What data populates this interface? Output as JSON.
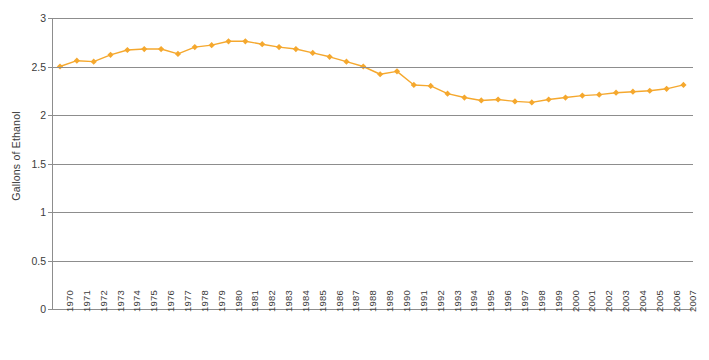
{
  "chart_data": {
    "type": "line",
    "title": "",
    "xlabel": "",
    "ylabel": "Gallons of Ethanol",
    "ylim": [
      0,
      3
    ],
    "yticks": [
      0,
      0.5,
      1,
      1.5,
      2,
      2.5,
      3
    ],
    "ytick_labels": [
      "0",
      "0.5",
      "1",
      "1.5",
      "2",
      "2.5",
      "3"
    ],
    "grid": true,
    "legend": "none",
    "series_color": "#f5a82e",
    "marker": "diamond",
    "categories": [
      "1970",
      "1971",
      "1972",
      "1973",
      "1974",
      "1975",
      "1976",
      "1977",
      "1978",
      "1979",
      "1980",
      "1981",
      "1982",
      "1983",
      "1984",
      "1985",
      "1986",
      "1987",
      "1988",
      "1989",
      "1990",
      "1991",
      "1992",
      "1993",
      "1994",
      "1995",
      "1996",
      "1997",
      "1998",
      "1999",
      "2000",
      "2001",
      "2002",
      "2003",
      "2004",
      "2005",
      "2006",
      "2007"
    ],
    "series": [
      {
        "name": "Gallons of Ethanol",
        "values": [
          2.5,
          2.56,
          2.55,
          2.62,
          2.67,
          2.68,
          2.68,
          2.63,
          2.7,
          2.72,
          2.76,
          2.76,
          2.73,
          2.7,
          2.68,
          2.64,
          2.6,
          2.55,
          2.5,
          2.42,
          2.45,
          2.31,
          2.3,
          2.22,
          2.18,
          2.15,
          2.16,
          2.14,
          2.13,
          2.16,
          2.18,
          2.2,
          2.21,
          2.23,
          2.24,
          2.25,
          2.27,
          2.31
        ]
      }
    ]
  }
}
